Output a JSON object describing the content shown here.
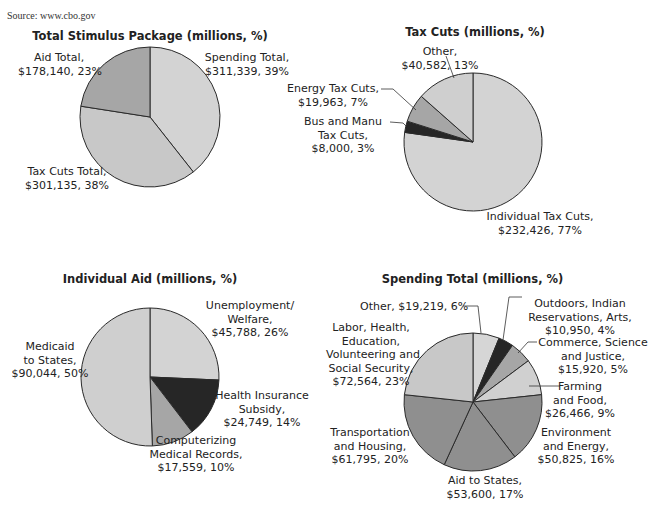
{
  "source": "Source: www.cbo.gov",
  "chart_data": [
    {
      "type": "pie",
      "title": "Total Stimulus Package (millions, %)",
      "categories": [
        "Spending Total",
        "Tax Cuts Total",
        "Aid Total"
      ],
      "values": [
        311339,
        301135,
        178140
      ],
      "percents": [
        39,
        38,
        23
      ],
      "colors": [
        "#d3d3d3",
        "#c8c8c8",
        "#a6a6a6"
      ]
    },
    {
      "type": "pie",
      "title": "Tax Cuts (millions, %)",
      "categories": [
        "Individual Tax Cuts",
        "Bus and Manu Tax Cuts",
        "Energy Tax Cuts",
        "Other"
      ],
      "values": [
        232426,
        8000,
        19963,
        40582
      ],
      "percents": [
        77,
        3,
        7,
        13
      ],
      "colors": [
        "#d3d3d3",
        "#262626",
        "#a6a6a6",
        "#cfcfcf"
      ]
    },
    {
      "type": "pie",
      "title": "Individual Aid (millions, %)",
      "categories": [
        "Unemployment/ Welfare",
        "Health Insurance Subsidy",
        "Computerizing Medical Records",
        "Medicaid to States"
      ],
      "values": [
        45788,
        24749,
        17559,
        90044
      ],
      "percents": [
        26,
        14,
        10,
        50
      ],
      "colors": [
        "#d3d3d3",
        "#262626",
        "#a6a6a6",
        "#cfcfcf"
      ]
    },
    {
      "type": "pie",
      "title": "Spending Total (millions, %)",
      "categories": [
        "Other",
        "Outdoors, Indian Reservations, Arts",
        "Commerce, Science and Justice",
        "Farming and Food",
        "Environment and Energy",
        "Aid to States",
        "Transportation and Housing",
        "Labor, Health, Education, Volunteering and Social Security"
      ],
      "values": [
        19219,
        10950,
        15920,
        26466,
        50825,
        53600,
        61795,
        72564
      ],
      "percents": [
        6,
        4,
        5,
        9,
        16,
        17,
        20,
        23
      ],
      "colors": [
        "#d6d6d6",
        "#262626",
        "#a6a6a6",
        "#d0d0d0",
        "#8f8f8f",
        "#8f8f8f",
        "#8f8f8f",
        "#c8c8c8"
      ]
    }
  ],
  "labels": {
    "c1": {
      "spending": [
        "Spending Total,",
        "$311,339, 39%"
      ],
      "taxcuts": [
        "Tax Cuts Total,",
        "$301,135, 38%"
      ],
      "aid": [
        "Aid Total,",
        "$178,140, 23%"
      ]
    },
    "c2": {
      "other": [
        "Other,",
        "$40,582, 13%"
      ],
      "energy": [
        "Energy Tax Cuts,",
        "$19,963, 7%"
      ],
      "bus": [
        "Bus and Manu",
        "Tax Cuts,",
        "$8,000, 3%"
      ],
      "individual": [
        "Individual Tax Cuts,",
        "$232,426, 77%"
      ]
    },
    "c3": {
      "unemployment": [
        "Unemployment/",
        "Welfare,",
        "$45,788, 26%"
      ],
      "health": [
        "Health Insurance",
        "Subsidy,",
        "$24,749, 14%"
      ],
      "computerizing": [
        "Computerizing",
        "Medical Records,",
        "$17,559, 10%"
      ],
      "medicaid": [
        "Medicaid",
        "to States,",
        "$90,044, 50%"
      ]
    },
    "c4": {
      "other": [
        "Other, $19,219, 6%"
      ],
      "outdoors": [
        "Outdoors, Indian",
        "Reservations, Arts,",
        "$10,950, 4%"
      ],
      "commerce": [
        "Commerce, Science",
        "and Justice,",
        "$15,920, 5%"
      ],
      "farming": [
        "Farming",
        "and Food,",
        "$26,466, 9%"
      ],
      "environment": [
        "Environment",
        "and Energy,",
        "$50,825, 16%"
      ],
      "aidstates": [
        "Aid to States,",
        "$53,600, 17%"
      ],
      "transport": [
        "Transportation",
        "and Housing,",
        "$61,795, 20%"
      ],
      "labor": [
        "Labor, Health,",
        "Education,",
        "Volunteering and",
        "Social Security,",
        "$72,564, 23%"
      ]
    }
  }
}
